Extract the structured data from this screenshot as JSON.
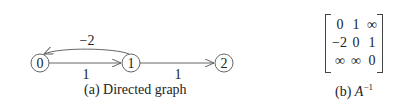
{
  "graph": {
    "nodes": [
      {
        "id": "0",
        "label": "0"
      },
      {
        "id": "1",
        "label": "1"
      },
      {
        "id": "2",
        "label": "2"
      }
    ],
    "edges": [
      {
        "from": "0",
        "to": "1",
        "weight": "1",
        "style": "straight"
      },
      {
        "from": "1",
        "to": "0",
        "weight": "−2",
        "style": "curved-above"
      },
      {
        "from": "1",
        "to": "2",
        "weight": "1",
        "style": "straight"
      }
    ],
    "caption": "(a) Directed graph"
  },
  "matrix": {
    "rows": [
      [
        "0",
        "1",
        "∞"
      ],
      [
        "−2",
        "0",
        "1"
      ],
      [
        "∞",
        "∞",
        "0"
      ]
    ],
    "caption_prefix": "(b) ",
    "caption_symbol": "A",
    "caption_superscript": "−1"
  },
  "colors": {
    "line": "#555555",
    "text": "#222222"
  }
}
